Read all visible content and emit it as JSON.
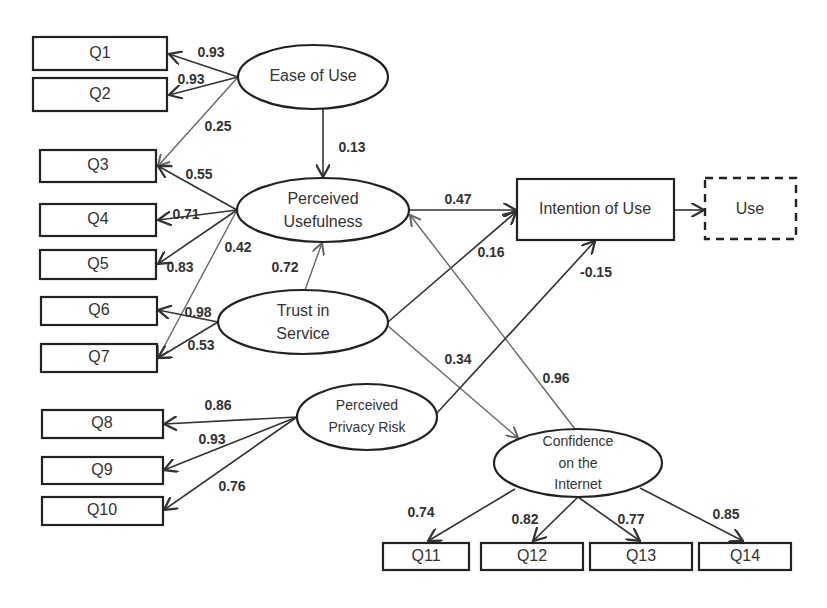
{
  "diagram": {
    "type": "structural-equation-model",
    "latent_constructs": {
      "ease_of_use": "Ease of Use",
      "perceived_usefulness_1": "Perceived",
      "perceived_usefulness_2": "Usefulness",
      "trust_in_service_1": "Trust in",
      "trust_in_service_2": "Service",
      "perceived_privacy_risk_1": "Perceived",
      "perceived_privacy_risk_2": "Privacy Risk",
      "confidence_internet_1": "Confidence",
      "confidence_internet_2": "on the",
      "confidence_internet_3": "Internet"
    },
    "outcomes": {
      "intention_of_use": "Intention of Use",
      "use": "Use"
    },
    "indicators": {
      "q1": "Q1",
      "q2": "Q2",
      "q3": "Q3",
      "q4": "Q4",
      "q5": "Q5",
      "q6": "Q6",
      "q7": "Q7",
      "q8": "Q8",
      "q9": "Q9",
      "q10": "Q10",
      "q11": "Q11",
      "q12": "Q12",
      "q13": "Q13",
      "q14": "Q14"
    },
    "loadings": {
      "eou_q1": "0.93",
      "eou_q2": "0.93",
      "eou_q3": "0.25",
      "pu_q3": "0.55",
      "pu_q4": "0.71",
      "pu_q5": "0.83",
      "pu_q7": "0.42",
      "tis_q6": "0.98",
      "tis_q7": "0.53",
      "ppr_q8": "0.86",
      "ppr_q9": "0.93",
      "ppr_q10": "0.76",
      "coi_q11": "0.74",
      "coi_q12": "0.82",
      "coi_q13": "0.77",
      "coi_q14": "0.85"
    },
    "paths": {
      "eou_pu": "0.13",
      "pu_iou": "0.47",
      "tis_pu": "0.72",
      "tis_iou": "0.16",
      "ppr_iou": "-0.15",
      "tis_coi": "0.34",
      "coi_pu": "0.96"
    }
  }
}
